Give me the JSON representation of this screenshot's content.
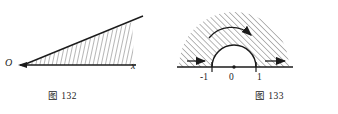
{
  "page": {
    "width": 338,
    "height": 114,
    "background": "#ffffff",
    "ink_color": "#1b1b1b",
    "hatch_color": "#555555"
  },
  "figures": [
    {
      "id": "fig-132",
      "caption": "图 132",
      "description": "An angle with vertex O, one ray along the horizontal x-axis and one ray rising to the upper right; the interior of the angle is hatched.",
      "vertex_label": "O",
      "ray_label": "x",
      "hatch_angle_deg": 80
    },
    {
      "id": "fig-133",
      "caption": "图 133",
      "description": "A horizontal number line with a semicircle of radius 1 above it; the region outside the semicircle and above the line is hatched, with direction arrows.",
      "tick_labels": [
        "-1",
        "0",
        "1"
      ],
      "origin_dot": true,
      "arc_arrow": true,
      "axis_arrows": [
        "right",
        "right"
      ],
      "hatch_angle_deg": 45
    }
  ]
}
